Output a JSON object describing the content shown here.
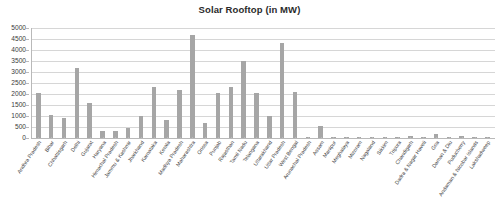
{
  "chart_data": {
    "type": "bar",
    "title": "Solar Rooftop (in MW)",
    "xlabel": "",
    "ylabel": "",
    "ylim": [
      0,
      5000
    ],
    "ytick_step": 500,
    "yticks": [
      "5000",
      "4500",
      "4000",
      "3500",
      "3000",
      "2500",
      "2000",
      "1500",
      "1000",
      "500",
      "0"
    ],
    "grid": true,
    "legend": false,
    "bar_color": "#a6a6a6",
    "categories": [
      "Andhra Pradesh",
      "Bihar",
      "Chhattisgarh",
      "Delhi",
      "Gujarat",
      "Haryana",
      "Himachal Pradesh",
      "Jammu & Kashmir",
      "Jharkhand",
      "Karnataka",
      "Kerala",
      "Madhya Pradesh",
      "Maharashtra",
      "Orissa",
      "Punjab",
      "Rajasthan",
      "Tamil Nadu",
      "Telangana",
      "Uttarakhand",
      "Uttar Pradesh",
      "West Bengal",
      "Arunachal Pradesh",
      "Assam",
      "Manipur",
      "Meghalaya",
      "Mizoram",
      "Nagaland",
      "Sikkim",
      "Tripura",
      "Chandigarh",
      "Dadra & Nagar Haveli",
      "Goa",
      "Daman & Diu",
      "Puducherry",
      "Andaman & Nicobar Islands",
      "Lakshadweep"
    ],
    "values": [
      2050,
      1050,
      900,
      3200,
      1600,
      300,
      320,
      450,
      1000,
      2300,
      800,
      2200,
      4700,
      700,
      2050,
      2300,
      3500,
      2050,
      1000,
      4300,
      2100,
      10,
      550,
      20,
      15,
      12,
      20,
      25,
      35,
      110,
      40,
      180,
      25,
      110,
      50,
      20
    ]
  }
}
